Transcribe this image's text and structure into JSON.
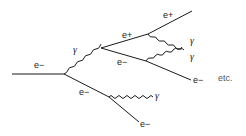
{
  "diagram": {
    "type": "electromagnetic-shower",
    "labels": {
      "incoming_electron": "e−",
      "first_photon": "γ",
      "positron_1": "e+",
      "positron_2": "e+",
      "electron_pair": "e−",
      "photon_upper_right_1": "γ",
      "photon_upper_right_2": "γ",
      "electron_right": "e−",
      "electron_lower": "e−",
      "photon_lower": "γ",
      "electron_bottom": "e−",
      "continuation": "etc."
    },
    "colors": {
      "line": "#1a1a1a",
      "text": "#222222"
    }
  }
}
